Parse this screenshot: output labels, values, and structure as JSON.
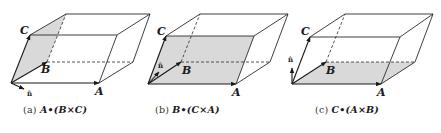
{
  "figure": {
    "panels": [
      {
        "id": "a",
        "caption_tag": "(a)",
        "caption_expr": "A•(B×C)",
        "shaded_face": "B-C face",
        "normal_label": "n̂",
        "vector_labels": {
          "A": "A",
          "B": "B",
          "C": "C"
        }
      },
      {
        "id": "b",
        "caption_tag": "(b)",
        "caption_expr": "B•(C×A)",
        "shaded_face": "C-A face",
        "normal_label": "n̂",
        "vector_labels": {
          "A": "A",
          "B": "B",
          "C": "C"
        }
      },
      {
        "id": "c",
        "caption_tag": "(c)",
        "caption_expr": "C•(A×B)",
        "shaded_face": "A-B face",
        "normal_label": "n̂",
        "vector_labels": {
          "A": "A",
          "B": "B",
          "C": "C"
        }
      }
    ],
    "colors": {
      "stroke": "#2b2b2b",
      "shade": "#d9d9d9",
      "background": "#ffffff"
    }
  }
}
